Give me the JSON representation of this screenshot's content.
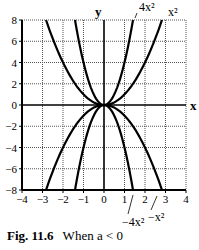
{
  "chart_data": {
    "type": "line",
    "title": "",
    "xlabel": "x",
    "ylabel": "y",
    "xlim": [
      -4,
      4
    ],
    "ylim": [
      -8,
      8
    ],
    "x_ticks": [
      -4,
      -3,
      -2,
      -1,
      0,
      1,
      2,
      3,
      4
    ],
    "y_ticks": [
      -8,
      -6,
      -4,
      -2,
      0,
      2,
      4,
      6,
      8
    ],
    "grid": true,
    "grid_style": "dotted",
    "series": [
      {
        "name": "4x^2",
        "label": "4x²",
        "a": 4
      },
      {
        "name": "x^2",
        "label": "x²",
        "a": 1
      },
      {
        "name": "-4x^2",
        "label": "−4x²",
        "a": -4
      },
      {
        "name": "-x^2",
        "label": "−x²",
        "a": -1
      }
    ],
    "annotations": [
      {
        "text": "4x²",
        "points_to": "4x^2",
        "position": "top"
      },
      {
        "text": "x²",
        "points_to": "x^2",
        "position": "top"
      },
      {
        "text": "−4x²",
        "points_to": "-4x^2",
        "position": "bottom"
      },
      {
        "text": "−x²",
        "points_to": "-x^2",
        "position": "bottom"
      }
    ]
  },
  "caption": {
    "fig_label": "Fig. 11.6",
    "text": "When a < 0"
  },
  "axis": {
    "x_label": "x",
    "y_label": "y"
  }
}
